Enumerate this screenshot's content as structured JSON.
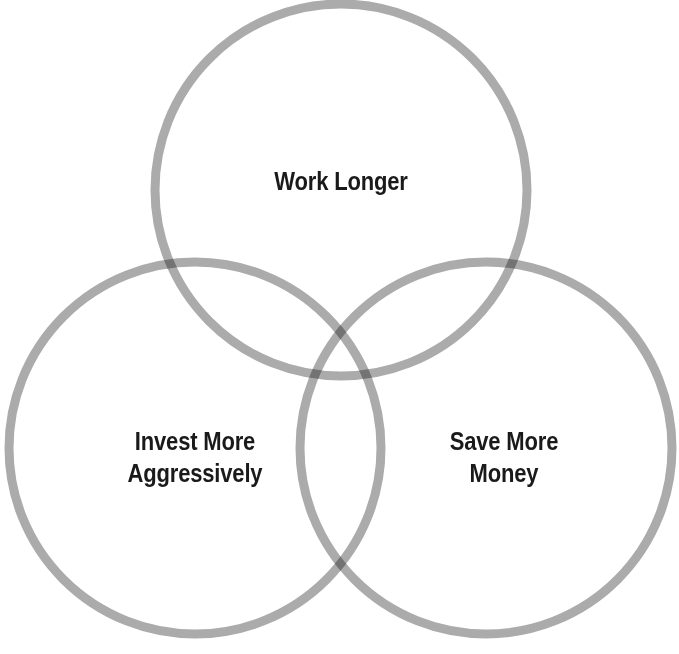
{
  "diagram": {
    "type": "venn",
    "set_count": 3,
    "background_color": "#ffffff",
    "text_color": "#1a1a1a",
    "ring_color": "#ababab",
    "pair_overlap_color": "#7a7a7a",
    "center_overlap_color": "#3f3f3f",
    "stroke_width": 9,
    "radius": 186,
    "circles": [
      {
        "id": "top",
        "label": "Work Longer",
        "cx": 341,
        "cy": 190
      },
      {
        "id": "bottom-left",
        "label": "Invest More\nAggressively",
        "cx": 195,
        "cy": 448
      },
      {
        "id": "bottom-right",
        "label": "Save More\nMoney",
        "cx": 486,
        "cy": 448
      }
    ],
    "labels": {
      "top": "Work Longer",
      "bottom_left": "Invest More\nAggressively",
      "bottom_right": "Save More\nMoney"
    }
  }
}
